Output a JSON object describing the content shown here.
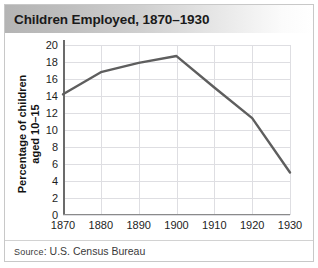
{
  "figure": {
    "title": "Children Employed, 1870–1930",
    "source_prefix": "Source",
    "source_rest": ": U.S. Census Bureau",
    "accent_line_color": "#5e5e5e",
    "grid_color": "#dedee2",
    "axis_color": "#6b6b6b",
    "title_bar_from": "#b4b4b4",
    "title_bar_to": "#ffffff"
  },
  "chart_data": {
    "type": "line",
    "title": "Children Employed, 1870–1930",
    "xlabel": "",
    "ylabel": "Percentage of children\naged 10–15",
    "x": [
      1870,
      1880,
      1890,
      1900,
      1910,
      1920,
      1930
    ],
    "categories": [
      "1870",
      "1880",
      "1890",
      "1900",
      "1910",
      "1920",
      "1930"
    ],
    "values": [
      14.2,
      16.8,
      17.9,
      18.7,
      15.0,
      11.4,
      5.0
    ],
    "series": [
      {
        "name": "Percentage of children aged 10–15 employed",
        "values": [
          14.2,
          16.8,
          17.9,
          18.7,
          15.0,
          11.4,
          5.0
        ]
      }
    ],
    "xlim": [
      1870,
      1930
    ],
    "ylim": [
      0,
      20
    ],
    "yticks": [
      0,
      2,
      4,
      6,
      8,
      10,
      12,
      14,
      16,
      18,
      20
    ],
    "ytick_labels": [
      "0",
      "2",
      "4",
      "6",
      "8",
      "10",
      "12",
      "14",
      "16",
      "18",
      "20"
    ],
    "xticks": [
      1870,
      1880,
      1890,
      1900,
      1910,
      1920,
      1930
    ],
    "xtick_labels": [
      "1870",
      "1880",
      "1890",
      "1900",
      "1910",
      "1920",
      "1930"
    ],
    "grid": true,
    "legend": false,
    "line_color": "#5e5e5e",
    "line_width": 2.4,
    "markers": false,
    "annotations": []
  }
}
